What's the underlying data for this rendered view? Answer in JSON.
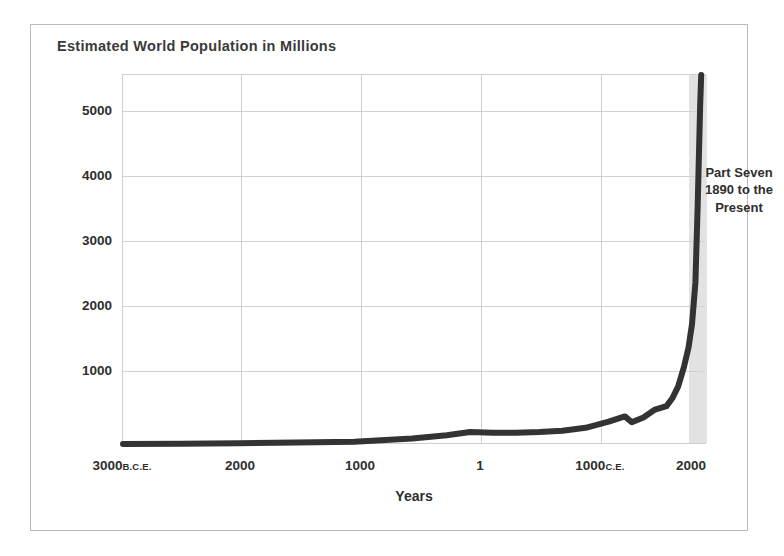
{
  "chart_data": {
    "type": "line",
    "title": "Estimated World Population in Millions",
    "xlabel": "Years",
    "ylabel": "",
    "grid": true,
    "legend": false,
    "xlim": [
      -3000,
      2050
    ],
    "ylim": [
      0,
      5700
    ],
    "ytick_values": [
      1000,
      2000,
      3000,
      4000,
      5000
    ],
    "ytick_labels": [
      "1000",
      "2000",
      "3000",
      "4000",
      "5000"
    ],
    "xtick_values": [
      -3000,
      -2000,
      -1000,
      1,
      1000,
      2000
    ],
    "xticks": [
      {
        "label": "3000",
        "era": "B.C.E.",
        "value": -3000
      },
      {
        "label": "2000",
        "era": "",
        "value": -2000
      },
      {
        "label": "1000",
        "era": "",
        "value": -1000
      },
      {
        "label": "1",
        "era": "",
        "value": 1
      },
      {
        "label": "1000",
        "era": "C.E.",
        "value": 1000
      },
      {
        "label": "2000",
        "era": "",
        "value": 2000
      }
    ],
    "series": [
      {
        "name": "World population (millions)",
        "x": [
          -3000,
          -2500,
          -2000,
          -1500,
          -1000,
          -500,
          -200,
          1,
          200,
          400,
          600,
          800,
          1000,
          1200,
          1340,
          1400,
          1500,
          1600,
          1700,
          1750,
          1800,
          1850,
          1890,
          1920,
          1950,
          1970,
          1990,
          2000
        ],
        "values": [
          14,
          20,
          27,
          38,
          50,
          100,
          150,
          200,
          190,
          190,
          200,
          220,
          265,
          360,
          440,
          350,
          425,
          545,
          600,
          720,
          900,
          1200,
          1500,
          1860,
          2500,
          3700,
          5200,
          6100
        ]
      }
    ],
    "annotations": [
      {
        "name": "part-seven-callout",
        "text": "Part Seven\n1890 to the\nPresent",
        "region_start_year": 1890,
        "region_end_year": 2000,
        "shade_color": "#e2e2e2"
      }
    ],
    "colors": {
      "line": "#333333",
      "grid": "#d2d2d2",
      "text": "#2e2e2e",
      "title": "#3a3a3a",
      "plot_border": "#cfcfcf",
      "figure_border": "#b9b9b9",
      "background": "#ffffff"
    }
  }
}
